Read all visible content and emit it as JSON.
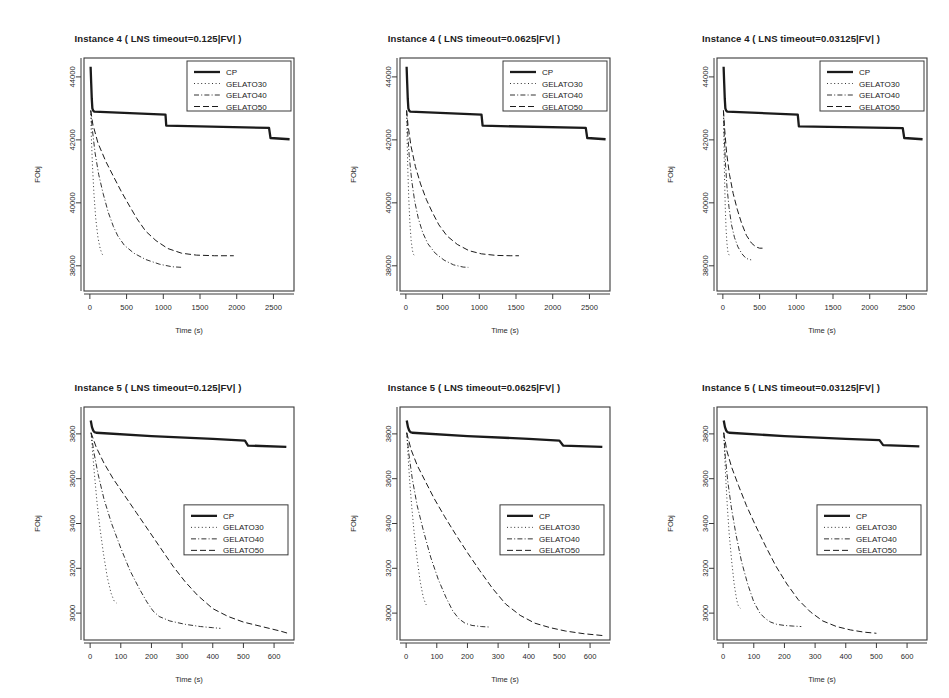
{
  "figure": {
    "axis_x_label": "Time (s)",
    "axis_y_label": "FObj",
    "series_names": [
      "CP",
      "GELATO30",
      "GELATO40",
      "GELATO50"
    ],
    "legend": {
      "items": [
        {
          "label": "CP",
          "style": "solid-thick"
        },
        {
          "label": "GELATO30",
          "style": "dotted"
        },
        {
          "label": "GELATO40",
          "style": "dash-dot"
        },
        {
          "label": "GELATO50",
          "style": "dashed"
        }
      ]
    }
  },
  "chart_data": [
    {
      "type": "line",
      "panel": "top-left",
      "title": "Instance 4 ( LNS timeout=0.125|FV| )",
      "xlabel": "Time (s)",
      "ylabel": "FObj",
      "xlim": [
        -80,
        2780
      ],
      "ylim": [
        37200,
        44600
      ],
      "xticks": [
        0,
        500,
        1000,
        1500,
        2000,
        2500
      ],
      "yticks": [
        38000,
        40000,
        42000,
        44000
      ],
      "grid": false,
      "legend_position": "top-right",
      "series": [
        {
          "name": "CP",
          "style": "solid-thick",
          "x": [
            10,
            18,
            26,
            34,
            45,
            60,
            1030,
            1040,
            2440,
            2460,
            2720
          ],
          "y": [
            44320,
            43800,
            43300,
            43000,
            42930,
            42900,
            42800,
            42450,
            42380,
            42060,
            42020
          ]
        },
        {
          "name": "GELATO30",
          "style": "dotted",
          "x": [
            12,
            20,
            35,
            55,
            80,
            110,
            140,
            165,
            180,
            195
          ],
          "y": [
            42930,
            42100,
            41200,
            40300,
            39500,
            38900,
            38550,
            38380,
            38330,
            38320
          ]
        },
        {
          "name": "GELATO40",
          "style": "dash-dot",
          "x": [
            12,
            30,
            70,
            120,
            180,
            250,
            320,
            380,
            470,
            600,
            760,
            950,
            1120,
            1260
          ],
          "y": [
            42930,
            42400,
            41600,
            40900,
            40300,
            39700,
            39250,
            38950,
            38650,
            38400,
            38200,
            38050,
            37970,
            37950
          ]
        },
        {
          "name": "GELATO50",
          "style": "dashed",
          "x": [
            12,
            40,
            110,
            220,
            330,
            430,
            540,
            640,
            760,
            900,
            1060,
            1250,
            1450,
            1700,
            1960
          ],
          "y": [
            42930,
            42500,
            41900,
            41300,
            40800,
            40350,
            39900,
            39500,
            39100,
            38800,
            38550,
            38400,
            38340,
            38320,
            38320
          ]
        }
      ]
    },
    {
      "type": "line",
      "panel": "top-center",
      "title": "Instance 4 ( LNS timeout=0.0625|FV| )",
      "xlabel": "Time (s)",
      "ylabel": "FObj",
      "xlim": [
        -80,
        2780
      ],
      "ylim": [
        37200,
        44600
      ],
      "xticks": [
        0,
        500,
        1000,
        1500,
        2000,
        2500
      ],
      "yticks": [
        38000,
        40000,
        42000,
        44000
      ],
      "grid": false,
      "legend_position": "top-right",
      "series": [
        {
          "name": "CP",
          "style": "solid-thick",
          "x": [
            10,
            18,
            26,
            34,
            45,
            60,
            1030,
            1045,
            2450,
            2470,
            2720
          ],
          "y": [
            44320,
            43800,
            43300,
            43000,
            42930,
            42900,
            42800,
            42450,
            42380,
            42060,
            42020
          ]
        },
        {
          "name": "GELATO30",
          "style": "dotted",
          "x": [
            10,
            16,
            26,
            40,
            56,
            72,
            90,
            105,
            115
          ],
          "y": [
            42930,
            42100,
            41100,
            40100,
            39300,
            38800,
            38480,
            38360,
            38340
          ]
        },
        {
          "name": "GELATO40",
          "style": "dash-dot",
          "x": [
            10,
            22,
            45,
            80,
            120,
            170,
            230,
            300,
            400,
            520,
            650,
            780,
            850
          ],
          "y": [
            42930,
            42350,
            41500,
            40700,
            40050,
            39500,
            39050,
            38700,
            38400,
            38180,
            38030,
            37960,
            37950
          ]
        },
        {
          "name": "GELATO50",
          "style": "dashed",
          "x": [
            10,
            30,
            70,
            130,
            200,
            280,
            360,
            450,
            560,
            700,
            860,
            1030,
            1230,
            1420,
            1540
          ],
          "y": [
            42930,
            42450,
            41800,
            41150,
            40600,
            40100,
            39700,
            39300,
            38950,
            38680,
            38480,
            38380,
            38330,
            38320,
            38320
          ]
        }
      ]
    },
    {
      "type": "line",
      "panel": "top-right",
      "title": "Instance 4 ( LNS timeout=0.03125|FV| )",
      "xlabel": "Time (s)",
      "ylabel": "FObj",
      "xlim": [
        -80,
        2780
      ],
      "ylim": [
        37200,
        44600
      ],
      "xticks": [
        0,
        500,
        1000,
        1500,
        2000,
        2500
      ],
      "yticks": [
        38000,
        40000,
        42000,
        44000
      ],
      "grid": false,
      "legend_position": "top-right",
      "series": [
        {
          "name": "CP",
          "style": "solid-thick",
          "x": [
            10,
            18,
            26,
            34,
            45,
            60,
            1020,
            1035,
            2450,
            2470,
            2720
          ],
          "y": [
            44320,
            43800,
            43300,
            43000,
            42930,
            42900,
            42800,
            42430,
            42370,
            42060,
            42020
          ]
        },
        {
          "name": "GELATO30",
          "style": "dotted",
          "x": [
            8,
            14,
            22,
            32,
            44,
            56,
            68,
            78,
            88
          ],
          "y": [
            42930,
            42000,
            40900,
            39900,
            39150,
            38700,
            38450,
            38360,
            38350
          ]
        },
        {
          "name": "GELATO40",
          "style": "dash-dot",
          "x": [
            8,
            18,
            34,
            56,
            84,
            118,
            158,
            205,
            260,
            310,
            355,
            385
          ],
          "y": [
            42930,
            42200,
            41300,
            40500,
            39850,
            39300,
            38900,
            38600,
            38380,
            38250,
            38200,
            38190
          ]
        },
        {
          "name": "GELATO50",
          "style": "dashed",
          "x": [
            8,
            24,
            50,
            90,
            140,
            195,
            255,
            320,
            390,
            450,
            500,
            540
          ],
          "y": [
            42930,
            42350,
            41600,
            40900,
            40300,
            39800,
            39350,
            38970,
            38720,
            38600,
            38560,
            38560
          ]
        }
      ]
    },
    {
      "type": "line",
      "panel": "bottom-left",
      "title": "Instance 5 ( LNS timeout=0.125|FV| )",
      "xlabel": "Time (s)",
      "ylabel": "FObj",
      "xlim": [
        -20,
        665
      ],
      "ylim": [
        2880,
        3920
      ],
      "xticks": [
        0,
        100,
        200,
        300,
        400,
        500,
        600
      ],
      "yticks": [
        3000,
        3200,
        3400,
        3600,
        3800
      ],
      "grid": false,
      "legend_position": "center-right",
      "series": [
        {
          "name": "CP",
          "style": "solid-thick",
          "x": [
            2,
            6,
            10,
            14,
            20,
            200,
            400,
            505,
            515,
            640
          ],
          "y": [
            3860,
            3830,
            3815,
            3808,
            3805,
            3790,
            3778,
            3770,
            3748,
            3742
          ]
        },
        {
          "name": "GELATO30",
          "style": "dotted",
          "x": [
            3,
            8,
            14,
            22,
            32,
            44,
            56,
            68,
            78,
            86
          ],
          "y": [
            3805,
            3720,
            3620,
            3500,
            3380,
            3260,
            3160,
            3090,
            3055,
            3045
          ]
        },
        {
          "name": "GELATO40",
          "style": "dash-dot",
          "x": [
            3,
            12,
            26,
            45,
            70,
            100,
            130,
            160,
            185,
            205,
            225,
            260,
            310,
            360,
            400,
            425
          ],
          "y": [
            3805,
            3720,
            3620,
            3510,
            3400,
            3290,
            3190,
            3110,
            3050,
            3010,
            2985,
            2965,
            2950,
            2940,
            2935,
            2932
          ]
        },
        {
          "name": "GELATO50",
          "style": "dashed",
          "x": [
            3,
            20,
            45,
            75,
            110,
            150,
            190,
            230,
            270,
            310,
            350,
            400,
            450,
            500,
            560,
            620,
            645
          ],
          "y": [
            3805,
            3740,
            3670,
            3600,
            3530,
            3450,
            3370,
            3290,
            3210,
            3140,
            3080,
            3020,
            2985,
            2960,
            2940,
            2920,
            2910
          ]
        }
      ]
    },
    {
      "type": "line",
      "panel": "bottom-center",
      "title": "Instance 5 ( LNS timeout=0.0625|FV| )",
      "xlabel": "Time (s)",
      "ylabel": "FObj",
      "xlim": [
        -20,
        665
      ],
      "ylim": [
        2880,
        3920
      ],
      "xticks": [
        0,
        100,
        200,
        300,
        400,
        500,
        600
      ],
      "yticks": [
        3000,
        3200,
        3400,
        3600,
        3800
      ],
      "grid": false,
      "legend_position": "center-right",
      "series": [
        {
          "name": "CP",
          "style": "solid-thick",
          "x": [
            2,
            6,
            10,
            14,
            20,
            200,
            400,
            500,
            512,
            640
          ],
          "y": [
            3860,
            3830,
            3815,
            3808,
            3805,
            3790,
            3778,
            3770,
            3748,
            3742
          ]
        },
        {
          "name": "GELATO30",
          "style": "dotted",
          "x": [
            2,
            6,
            11,
            18,
            26,
            36,
            46,
            56,
            64,
            70
          ],
          "y": [
            3805,
            3710,
            3600,
            3480,
            3360,
            3240,
            3140,
            3070,
            3040,
            3030
          ]
        },
        {
          "name": "GELATO40",
          "style": "dash-dot",
          "x": [
            2,
            9,
            20,
            36,
            56,
            80,
            105,
            130,
            152,
            172,
            192,
            215,
            245,
            270
          ],
          "y": [
            3805,
            3710,
            3600,
            3480,
            3370,
            3250,
            3150,
            3070,
            3010,
            2975,
            2955,
            2945,
            2940,
            2938
          ]
        },
        {
          "name": "GELATO50",
          "style": "dashed",
          "x": [
            2,
            16,
            36,
            62,
            92,
            126,
            162,
            200,
            240,
            282,
            325,
            372,
            420,
            470,
            520,
            580,
            640
          ],
          "y": [
            3805,
            3730,
            3660,
            3590,
            3510,
            3430,
            3350,
            3270,
            3190,
            3110,
            3040,
            2990,
            2955,
            2935,
            2920,
            2908,
            2900
          ]
        }
      ]
    },
    {
      "type": "line",
      "panel": "bottom-right",
      "title": "Instance 5 ( LNS timeout=0.03125|FV| )",
      "xlabel": "Time (s)",
      "ylabel": "FObj",
      "xlim": [
        -20,
        665
      ],
      "ylim": [
        2880,
        3920
      ],
      "xticks": [
        0,
        100,
        200,
        300,
        400,
        500,
        600
      ],
      "yticks": [
        3000,
        3200,
        3400,
        3600,
        3800
      ],
      "grid": false,
      "legend_position": "center-right",
      "series": [
        {
          "name": "CP",
          "style": "solid-thick",
          "x": [
            2,
            6,
            10,
            14,
            20,
            200,
            400,
            510,
            522,
            640
          ],
          "y": [
            3860,
            3830,
            3815,
            3808,
            3805,
            3790,
            3778,
            3772,
            3750,
            3744
          ]
        },
        {
          "name": "GELATO30",
          "style": "dotted",
          "x": [
            2,
            5,
            9,
            14,
            20,
            28,
            36,
            44,
            50,
            56
          ],
          "y": [
            3805,
            3705,
            3590,
            3470,
            3350,
            3230,
            3130,
            3060,
            3030,
            3022
          ]
        },
        {
          "name": "GELATO40",
          "style": "dash-dot",
          "x": [
            2,
            7,
            15,
            27,
            42,
            60,
            80,
            100,
            120,
            138,
            155,
            175,
            200,
            230,
            255
          ],
          "y": [
            3805,
            3700,
            3590,
            3470,
            3350,
            3230,
            3130,
            3050,
            3000,
            2975,
            2960,
            2950,
            2945,
            2942,
            2940
          ]
        },
        {
          "name": "GELATO50",
          "style": "dashed",
          "x": [
            2,
            12,
            28,
            50,
            76,
            106,
            138,
            172,
            208,
            245,
            285,
            325,
            370,
            415,
            460,
            500
          ],
          "y": [
            3805,
            3725,
            3650,
            3570,
            3480,
            3390,
            3300,
            3210,
            3130,
            3060,
            3005,
            2965,
            2940,
            2925,
            2915,
            2910
          ]
        }
      ]
    }
  ]
}
